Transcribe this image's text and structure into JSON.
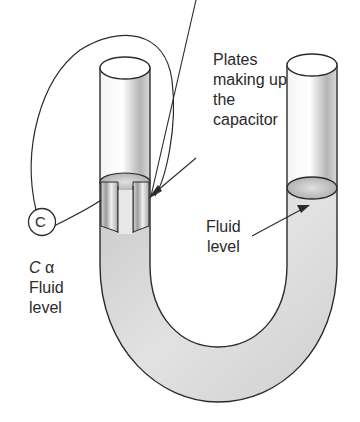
{
  "diagram": {
    "labels": {
      "plates": [
        "Plates",
        "making up",
        "the",
        "capacitor"
      ],
      "fluid_level_right": [
        "Fluid",
        "level"
      ],
      "relation": {
        "symbol_c": "C",
        "symbol_alpha": "α",
        "lines": [
          "Fluid",
          "level"
        ]
      },
      "capacitor_circle": "C"
    },
    "colors": {
      "outline": "#2b2b2b",
      "fluid_fill": "#d4d4d4",
      "tube_shade": "#bdbdbd",
      "background": "#ffffff"
    }
  }
}
